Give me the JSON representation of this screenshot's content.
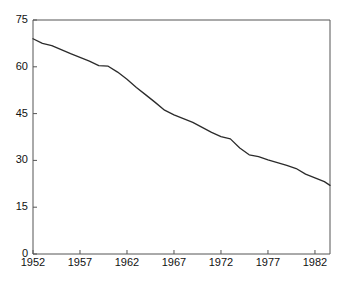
{
  "chart_data": {
    "type": "line",
    "title": "",
    "subtitle": "",
    "xlabel": "",
    "ylabel": "",
    "xlim": [
      1952,
      1983.6
    ],
    "ylim": [
      0,
      75
    ],
    "grid": false,
    "legend": null,
    "series_color": "#2b2b2b",
    "axis_color": "#555555",
    "xticks": [
      1952,
      1957,
      1962,
      1967,
      1972,
      1977,
      1982
    ],
    "xtick_labels": [
      "1952",
      "1957",
      "1962",
      "1967",
      "1972",
      "1977",
      "1982"
    ],
    "yticks": [
      0,
      15,
      30,
      45,
      60,
      75
    ],
    "ytick_labels": [
      "0",
      "15",
      "30",
      "45",
      "60",
      "75"
    ],
    "x": [
      1952,
      1953,
      1954,
      1955,
      1956,
      1957,
      1958,
      1959,
      1960,
      1961,
      1962,
      1963,
      1964,
      1965,
      1966,
      1967,
      1968,
      1969,
      1970,
      1971,
      1972,
      1973,
      1974,
      1975,
      1976,
      1977,
      1978,
      1979,
      1980,
      1981,
      1982,
      1983,
      1983.6
    ],
    "values": [
      69.0,
      67.5,
      66.8,
      65.5,
      64.2,
      63.0,
      61.8,
      60.4,
      60.2,
      58.3,
      56.0,
      53.4,
      51.0,
      48.6,
      46.1,
      44.6,
      43.4,
      42.2,
      40.6,
      39.0,
      37.6,
      36.9,
      34.0,
      31.8,
      31.2,
      30.2,
      29.3,
      28.4,
      27.4,
      25.6,
      24.4,
      23.2,
      22.0
    ]
  }
}
